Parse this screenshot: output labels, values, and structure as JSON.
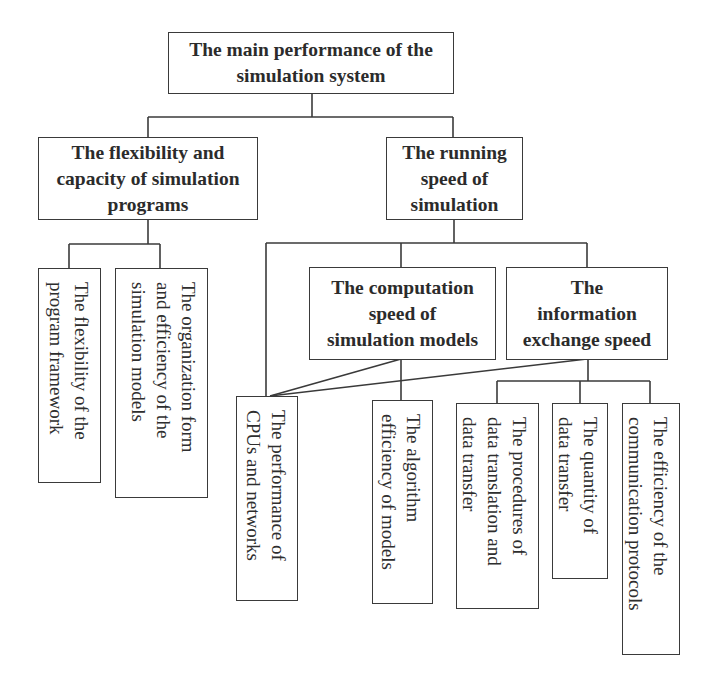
{
  "diagram": {
    "type": "hierarchy-tree",
    "root": {
      "id": "root",
      "lines": [
        "The main performance of the",
        "simulation system"
      ]
    },
    "level1": [
      {
        "id": "flexibility-capacity",
        "lines": [
          "The flexibility and",
          "capacity of simulation",
          "programs"
        ]
      },
      {
        "id": "running-speed",
        "lines": [
          "The running",
          "speed of",
          "simulation"
        ]
      }
    ],
    "level2": [
      {
        "id": "computation-speed",
        "lines": [
          "The computation",
          "speed of",
          "simulation models"
        ]
      },
      {
        "id": "information-exchange-speed",
        "lines": [
          "The",
          "information",
          "exchange speed"
        ]
      }
    ],
    "leaves": [
      {
        "id": "program-framework-flexibility",
        "parent": "flexibility-capacity",
        "lines": [
          "The flexibility of the",
          "program framework"
        ]
      },
      {
        "id": "organization-form-efficiency",
        "parent": "flexibility-capacity",
        "lines": [
          "The organization form",
          "and efficiency of the",
          "simulation models"
        ]
      },
      {
        "id": "cpu-network-performance",
        "parent": "running-speed, computation-speed, information-exchange-speed",
        "lines": [
          "The performance of",
          "CPUs and networks"
        ]
      },
      {
        "id": "algorithm-efficiency",
        "parent": "computation-speed",
        "lines": [
          "The algorithm",
          "efficiency of models"
        ]
      },
      {
        "id": "translation-transfer-procedures",
        "parent": "information-exchange-speed",
        "lines": [
          "The procedures of",
          "data translation and",
          "data transfer"
        ]
      },
      {
        "id": "data-transfer-quantity",
        "parent": "information-exchange-speed",
        "lines": [
          "The quantity of",
          "data transfer"
        ]
      },
      {
        "id": "protocol-efficiency",
        "parent": "information-exchange-speed",
        "lines": [
          "The efficiency of the",
          "communication protocols"
        ]
      }
    ]
  },
  "colors": {
    "line": "#3a3a3a",
    "text": "#2b2b2b",
    "background": "#ffffff"
  }
}
